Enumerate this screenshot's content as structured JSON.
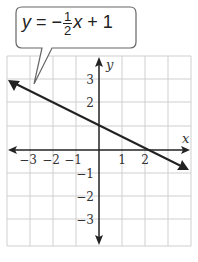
{
  "equation": {
    "lhs": "y",
    "equals": "=",
    "sign": "−",
    "frac_num": "1",
    "frac_den": "2",
    "var": "x",
    "plus": "+",
    "const": "1"
  },
  "axes": {
    "x_label": "x",
    "y_label": "y",
    "x_ticks": [
      "−3",
      "−2",
      "−1",
      "1",
      "2"
    ],
    "y_ticks": [
      "3",
      "2",
      "−1",
      "−2",
      "−3"
    ]
  },
  "line": {
    "slope": -0.5,
    "intercept": 1,
    "x_intercept": 2
  },
  "colors": {
    "grid": "#c8c8c8",
    "axis": "#222222",
    "line": "#222222",
    "callout_border": "#555555"
  }
}
